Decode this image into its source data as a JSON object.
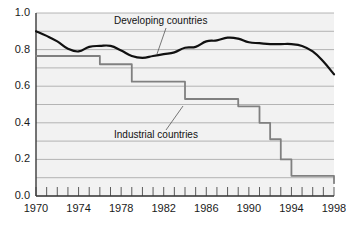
{
  "chart_data": {
    "type": "line",
    "title": "",
    "subtitle": "",
    "xlabel": "",
    "ylabel": "",
    "xlim": [
      1970,
      1998
    ],
    "ylim": [
      0.0,
      1.0
    ],
    "grid": true,
    "grid_interval": 0.1,
    "legend_position": "inline-annotations",
    "y_ticks": [
      "1.0",
      "0.8",
      "0.6",
      "0.4",
      "0.2",
      "0.0"
    ],
    "y_tick_values": [
      1.0,
      0.8,
      0.6,
      0.4,
      0.2,
      0.0
    ],
    "x_ticks": [
      "1970",
      "1974",
      "1978",
      "1982",
      "1986",
      "1990",
      "1994",
      "1998"
    ],
    "x_tick_values": [
      1970,
      1974,
      1978,
      1982,
      1986,
      1990,
      1994,
      1998
    ],
    "x_minor_tick_interval": 1,
    "x": [
      1970,
      1971,
      1972,
      1973,
      1974,
      1975,
      1976,
      1977,
      1978,
      1979,
      1980,
      1981,
      1982,
      1983,
      1984,
      1985,
      1986,
      1987,
      1988,
      1989,
      1990,
      1991,
      1992,
      1993,
      1994,
      1995,
      1996,
      1997,
      1998
    ],
    "series": [
      {
        "name": "Developing countries",
        "color": "#111111",
        "width": 2.2,
        "style": "smooth",
        "values": [
          0.9,
          0.875,
          0.845,
          0.805,
          0.79,
          0.815,
          0.82,
          0.82,
          0.795,
          0.765,
          0.755,
          0.765,
          0.775,
          0.785,
          0.81,
          0.815,
          0.845,
          0.85,
          0.865,
          0.86,
          0.84,
          0.835,
          0.83,
          0.83,
          0.83,
          0.82,
          0.79,
          0.735,
          0.665
        ]
      },
      {
        "name": "Industrial countries",
        "color": "#808080",
        "width": 1.8,
        "style": "step",
        "values": [
          0.765,
          0.765,
          0.765,
          0.765,
          0.765,
          0.765,
          0.72,
          0.72,
          0.72,
          0.625,
          0.625,
          0.625,
          0.625,
          0.625,
          0.53,
          0.53,
          0.53,
          0.53,
          0.53,
          0.49,
          0.49,
          0.4,
          0.31,
          0.2,
          0.11,
          0.11,
          0.11,
          0.11,
          0.07
        ]
      }
    ],
    "annotations": [
      {
        "id": "developing-annotation",
        "text": "Developing countries",
        "text_x": 114,
        "text_y": 24,
        "leader_from_x": 166,
        "leader_from_y": 28,
        "leader_to_x": 157,
        "leader_to_y": 54
      },
      {
        "id": "industrial-annotation",
        "text": "Industrial countries",
        "text_x": 114,
        "text_y": 138,
        "leader_from_x": 166,
        "leader_from_y": 130,
        "leader_to_x": 183,
        "leader_to_y": 106
      }
    ]
  }
}
